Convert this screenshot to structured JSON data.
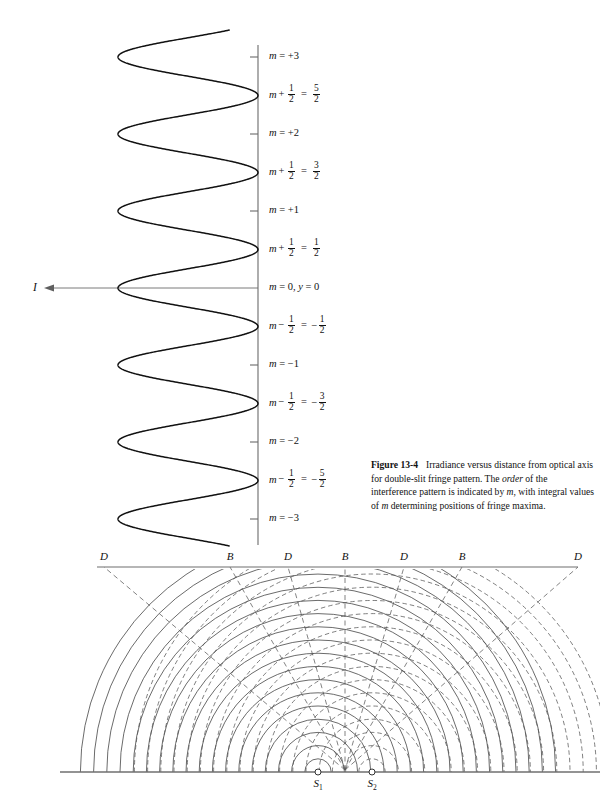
{
  "figure": {
    "number": "Figure 13-4",
    "caption_parts": {
      "lead": "Irradiance versus distance from optical axis for double-slit fringe pattern. The ",
      "italic1": "order",
      "mid": " of the interference pattern is indicated by ",
      "italic2": "m",
      "tail1": ", with integral values of ",
      "italic3": "m",
      "tail2": " determining positions of fringe maxima."
    }
  },
  "top_plot": {
    "irradiance_axis_label": "I",
    "axis_labels": [
      {
        "id": "m-plus-3",
        "kind": "integer",
        "m": 3,
        "text": "m = +3"
      },
      {
        "id": "m-plus-5-2",
        "kind": "half",
        "m": 2.5,
        "lhs_sym": "m",
        "lhs_op": "+",
        "lhs_num": "1",
        "lhs_den": "2",
        "eq": "=",
        "rhs_sign": "",
        "rhs_num": "5",
        "rhs_den": "2"
      },
      {
        "id": "m-plus-2",
        "kind": "integer",
        "m": 2,
        "text": "m = +2"
      },
      {
        "id": "m-plus-3-2",
        "kind": "half",
        "m": 1.5,
        "lhs_sym": "m",
        "lhs_op": "+",
        "lhs_num": "1",
        "lhs_den": "2",
        "eq": "=",
        "rhs_sign": "",
        "rhs_num": "3",
        "rhs_den": "2"
      },
      {
        "id": "m-plus-1",
        "kind": "integer",
        "m": 1,
        "text": "m = +1"
      },
      {
        "id": "m-plus-1-2",
        "kind": "half",
        "m": 0.5,
        "lhs_sym": "m",
        "lhs_op": "+",
        "lhs_num": "1",
        "lhs_den": "2",
        "eq": "=",
        "rhs_sign": "",
        "rhs_num": "1",
        "rhs_den": "2"
      },
      {
        "id": "m-zero",
        "kind": "integer",
        "m": 0,
        "text": "m = 0, y = 0"
      },
      {
        "id": "m-minus-1-2",
        "kind": "half",
        "m": -0.5,
        "lhs_sym": "m",
        "lhs_op": "−",
        "lhs_num": "1",
        "lhs_den": "2",
        "eq": "=",
        "rhs_sign": "−",
        "rhs_num": "1",
        "rhs_den": "2"
      },
      {
        "id": "m-minus-1",
        "kind": "integer",
        "m": -1,
        "text": "m = −1"
      },
      {
        "id": "m-minus-3-2",
        "kind": "half",
        "m": -1.5,
        "lhs_sym": "m",
        "lhs_op": "−",
        "lhs_num": "1",
        "lhs_den": "2",
        "eq": "=",
        "rhs_sign": "−",
        "rhs_num": "3",
        "rhs_den": "2"
      },
      {
        "id": "m-minus-2",
        "kind": "integer",
        "m": -2,
        "text": "m = −2"
      },
      {
        "id": "m-minus-5-2",
        "kind": "half",
        "m": -2.5,
        "lhs_sym": "m",
        "lhs_op": "−",
        "lhs_num": "1",
        "lhs_den": "2",
        "eq": "=",
        "rhs_sign": "−",
        "rhs_num": "5",
        "rhs_den": "2"
      },
      {
        "id": "m-minus-3",
        "kind": "integer",
        "m": -3,
        "text": "m = −3"
      }
    ]
  },
  "bottom_plot": {
    "screen_markers": [
      {
        "label": "D",
        "x": 104,
        "type": "dark"
      },
      {
        "label": "B",
        "x": 230,
        "type": "bright"
      },
      {
        "label": "D",
        "x": 288,
        "type": "dark"
      },
      {
        "label": "B",
        "x": 345,
        "type": "bright"
      },
      {
        "label": "D",
        "x": 404,
        "type": "dark"
      },
      {
        "label": "B",
        "x": 462,
        "type": "bright"
      },
      {
        "label": "D",
        "x": 578,
        "type": "dark"
      }
    ],
    "sources": [
      {
        "label": "S",
        "sub": "1",
        "x": 318
      },
      {
        "label": "S",
        "sub": "2",
        "x": 372
      }
    ]
  },
  "chart_data": {
    "type": "line",
    "xlabel": "I (irradiance)",
    "ylabel": "m (fringe order)",
    "orientation": "horizontal-intensity-vertical-position",
    "grid": false,
    "legend": null,
    "order_range": [
      -3.0,
      3.0
    ],
    "maxima_orders": [
      3,
      2,
      1,
      0,
      -1,
      -2,
      -3
    ],
    "minima_orders": [
      2.5,
      1.5,
      0.5,
      -0.5,
      -1.5,
      -2.5
    ],
    "normalized_irradiance_at_maxima": [
      1,
      1,
      1,
      1,
      1,
      1,
      1
    ],
    "normalized_irradiance_at_minima": [
      0,
      0,
      0,
      0,
      0,
      0
    ],
    "samples": {
      "m": [
        3.35,
        3.0,
        2.5,
        2.0,
        1.5,
        1.0,
        0.5,
        0.0,
        -0.5,
        -1.0,
        -1.5,
        -2.0,
        -2.5,
        -3.0,
        -3.35
      ],
      "I_normalized": [
        0.78,
        1.0,
        0.0,
        1.0,
        0.0,
        1.0,
        0.0,
        1.0,
        0.0,
        1.0,
        0.0,
        1.0,
        0.0,
        1.0,
        0.78
      ]
    }
  },
  "colors": {
    "ink": "#1a1a1a",
    "axis": "#6b6b6b",
    "curve": "#111111",
    "arc_solid": "#3a3a3a",
    "arc_dashed": "#5a5a5a",
    "screen": "#6f6f6f"
  }
}
